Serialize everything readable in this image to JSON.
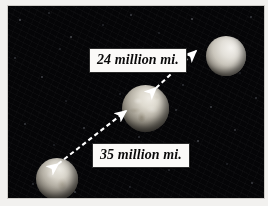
{
  "figure": {
    "name": "planet-distance-diagram",
    "background_color": "#050506",
    "mount_color": "#f2f1ef"
  },
  "labels": {
    "upper": "24 million mi.",
    "lower": "35 million mi."
  },
  "planets": [
    {
      "id": "planet-top-right",
      "name": "upper-right-planet",
      "cx": 218,
      "cy": 50,
      "r": 20
    },
    {
      "id": "planet-middle",
      "name": "center-planet",
      "cx": 138,
      "cy": 103,
      "r": 24
    },
    {
      "id": "planet-bottom-left",
      "name": "lower-left-planet",
      "cx": 49,
      "cy": 173,
      "r": 21
    }
  ],
  "arrows": [
    {
      "id": "arrow-upper",
      "name": "distance-arrow-upper",
      "label": "24 million mi.",
      "from": "center-planet",
      "to": "upper-right-planet",
      "style": "dashed",
      "heads": "both",
      "color": "#ffffff"
    },
    {
      "id": "arrow-lower",
      "name": "distance-arrow-lower",
      "label": "35 million mi.",
      "from": "lower-left-planet",
      "to": "center-planet",
      "style": "dashed",
      "heads": "both",
      "color": "#ffffff"
    }
  ]
}
